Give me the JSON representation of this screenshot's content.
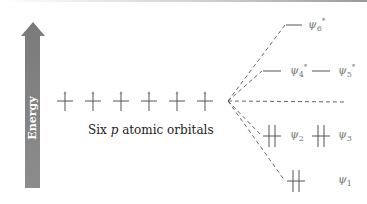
{
  "energy_axis": {
    "label": "Energy",
    "color": "#808080"
  },
  "atomic_orbitals": {
    "count": 6,
    "caption_prefix": "Six ",
    "caption_italic": "p",
    "caption_suffix": " atomic orbitals",
    "electrons_each": 1
  },
  "molecular_orbitals": [
    {
      "name": "ψ6*",
      "symbol": "ψ",
      "sub": "6",
      "sup": "*",
      "electrons": 0
    },
    {
      "name": "ψ4*",
      "symbol": "ψ",
      "sub": "4",
      "sup": "*",
      "electrons": 0
    },
    {
      "name": "ψ5*",
      "symbol": "ψ",
      "sub": "5",
      "sup": "*",
      "electrons": 0
    },
    {
      "name": "ψ2",
      "symbol": "ψ",
      "sub": "2",
      "sup": "",
      "electrons": 2
    },
    {
      "name": "ψ3",
      "symbol": "ψ",
      "sub": "3",
      "sup": "",
      "electrons": 2
    },
    {
      "name": "ψ1",
      "symbol": "ψ",
      "sub": "1",
      "sup": "",
      "electrons": 2
    }
  ]
}
